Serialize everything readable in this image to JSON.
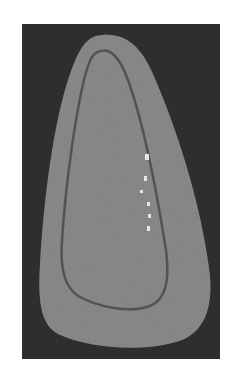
{
  "image": {
    "description": "Grayscale photograph of a rounded triangular object with an inner contour line on a dark background",
    "colors": {
      "page_background": "#ffffff",
      "frame_background": "#2e2e2e",
      "outer_shape": "#8c8c8c",
      "inner_contour": "#4a4a4a",
      "highlight": "#e6e6e6"
    }
  }
}
